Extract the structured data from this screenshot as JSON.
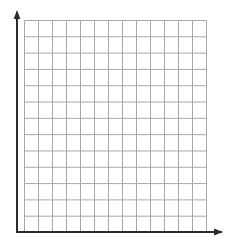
{
  "figure": {
    "kind": "blank-coordinate-grid",
    "title": "",
    "background_color": "#ffffff",
    "width_px": 234,
    "height_px": 247
  },
  "chart_data": {
    "type": "scatter",
    "title": "",
    "subtitle": "",
    "xlabel": "",
    "ylabel": "",
    "series": [],
    "categories": [],
    "values": [],
    "annotations": [],
    "legend": {
      "entries": [],
      "position": "none",
      "visible": false
    },
    "grid": {
      "visible": true,
      "columns": 13,
      "rows": 13,
      "cell_width_px": 14,
      "cell_height_px": 16.31,
      "line_color": "#a8a8a8",
      "line_width_px": 1,
      "left_px": 24,
      "top_px": 20,
      "right_px": 206,
      "bottom_px": 232
    },
    "axes": {
      "x": {
        "visible": true,
        "tick_labels": [],
        "range_labeled": false,
        "arrow": true,
        "start_x_px": 17,
        "end_x_px": 222,
        "y_px": 232,
        "color": "#2b2b2b",
        "line_width_px": 2
      },
      "y": {
        "visible": true,
        "tick_labels": [],
        "range_labeled": false,
        "arrow": true,
        "start_y_px": 232,
        "end_y_px": 12,
        "x_px": 17,
        "color": "#2b2b2b",
        "line_width_px": 2
      }
    },
    "arrowheads": {
      "y_tip": {
        "x_px": 17,
        "y_px": 10
      },
      "x_tip": {
        "x_px": 223,
        "y_px": 232
      },
      "color": "#2b2b2b",
      "half_width_px": 3.4,
      "length_px": 9
    }
  },
  "colors": {
    "grid_line": "#a8a8a8",
    "axis": "#2b2b2b",
    "background": "#ffffff"
  },
  "labels": {
    "x_axis_caption": "",
    "y_axis_caption": "",
    "origin_label": ""
  }
}
